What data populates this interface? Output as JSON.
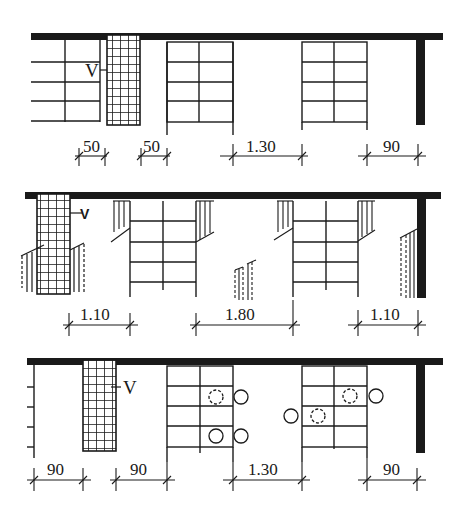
{
  "diagram": {
    "ink_color": "#1a1a1a",
    "background": "#ffffff",
    "rows": [
      {
        "id": "top",
        "label_v": "V",
        "dimensions": [
          {
            "label": "50",
            "x1": 75,
            "x2": 107,
            "y": 156
          },
          {
            "label": "50",
            "x1": 138,
            "x2": 167,
            "y": 156
          },
          {
            "label": "1.30",
            "x1": 232,
            "x2": 302,
            "y": 156
          },
          {
            "label": "90",
            "x1": 367,
            "x2": 417,
            "y": 156
          }
        ]
      },
      {
        "id": "middle",
        "label_v": "V",
        "dimensions": [
          {
            "label": "1.10",
            "x1": 68,
            "x2": 129,
            "y": 325
          },
          {
            "label": "1.80",
            "x1": 195,
            "x2": 293,
            "y": 325
          },
          {
            "label": "1.10",
            "x1": 355,
            "x2": 418,
            "y": 325
          }
        ]
      },
      {
        "id": "bottom",
        "label_v": "V",
        "dimensions": [
          {
            "label": "90",
            "x1": 33,
            "x2": 83,
            "y": 480
          },
          {
            "label": "90",
            "x1": 116,
            "x2": 166,
            "y": 480
          },
          {
            "label": "1.30",
            "x1": 232,
            "x2": 302,
            "y": 480
          },
          {
            "label": "90",
            "x1": 367,
            "x2": 417,
            "y": 480
          }
        ]
      }
    ]
  }
}
